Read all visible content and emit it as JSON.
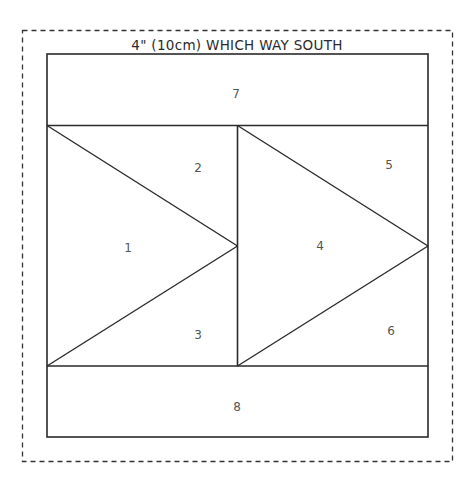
{
  "diagram": {
    "title": "4\" (10cm) WHICH WAY SOUTH",
    "colors": {
      "line": "#2a2a2a",
      "dashed_border": "#333333",
      "label": "#555555",
      "background": "#ffffff"
    },
    "pieces": [
      {
        "id": "1",
        "label": "1",
        "shape": "triangle",
        "x": 128,
        "y": 248
      },
      {
        "id": "2",
        "label": "2",
        "shape": "triangle",
        "x": 198,
        "y": 168
      },
      {
        "id": "3",
        "label": "3",
        "shape": "triangle",
        "x": 198,
        "y": 335
      },
      {
        "id": "4",
        "label": "4",
        "shape": "triangle",
        "x": 320,
        "y": 246
      },
      {
        "id": "5",
        "label": "5",
        "shape": "triangle",
        "x": 389,
        "y": 165
      },
      {
        "id": "6",
        "label": "6",
        "shape": "triangle",
        "x": 391,
        "y": 331
      },
      {
        "id": "7",
        "label": "7",
        "shape": "rectangle",
        "x": 236,
        "y": 94
      },
      {
        "id": "8",
        "label": "8",
        "shape": "rectangle",
        "x": 237,
        "y": 407
      }
    ]
  }
}
